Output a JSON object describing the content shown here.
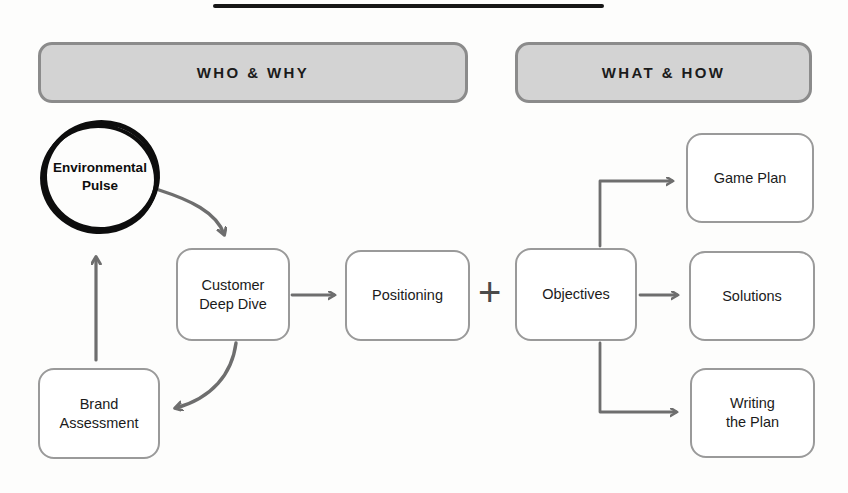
{
  "diagram": {
    "title_rule": "",
    "phases": [
      {
        "id": "who-why",
        "label": "WHO & WHY",
        "x": 38,
        "y": 42,
        "w": 430,
        "h": 61
      },
      {
        "id": "what-how",
        "label": "WHAT & HOW",
        "x": 515,
        "y": 42,
        "w": 297,
        "h": 61
      }
    ],
    "circle_node": {
      "id": "environmental-pulse",
      "label": "Environmental\nPulse",
      "line1": "Environmental",
      "line2": "Pulse",
      "cx": 100,
      "cy": 177
    },
    "nodes": [
      {
        "id": "customer-deep-dive",
        "label": "Customer\nDeep Dive",
        "line1": "Customer",
        "line2": "Deep Dive",
        "x": 176,
        "y": 248,
        "w": 114,
        "h": 93
      },
      {
        "id": "brand-assessment",
        "label": "Brand\nAssessment",
        "line1": "Brand",
        "line2": "Assessment",
        "x": 38,
        "y": 368,
        "w": 122,
        "h": 91
      },
      {
        "id": "positioning",
        "label": "Positioning",
        "line1": "Positioning",
        "line2": "",
        "x": 345,
        "y": 250,
        "w": 125,
        "h": 91
      },
      {
        "id": "objectives",
        "label": "Objectives",
        "line1": "Objectives",
        "line2": "",
        "x": 515,
        "y": 248,
        "w": 122,
        "h": 93
      },
      {
        "id": "game-plan",
        "label": "Game Plan",
        "line1": "Game Plan",
        "line2": "",
        "x": 686,
        "y": 133,
        "w": 128,
        "h": 90
      },
      {
        "id": "solutions",
        "label": "Solutions",
        "line1": "Solutions",
        "line2": "",
        "x": 689,
        "y": 251,
        "w": 126,
        "h": 90
      },
      {
        "id": "writing-the-plan",
        "label": "Writing\nthe Plan",
        "line1": "Writing",
        "line2": "the Plan",
        "x": 690,
        "y": 368,
        "w": 125,
        "h": 90
      }
    ],
    "plus_connector": {
      "id": "plus-connector",
      "label": "+",
      "x": 478,
      "y": 272
    },
    "colors": {
      "phase_bar_fill": "#d3d3d3",
      "phase_bar_stroke": "#8b8b8b",
      "node_stroke": "#9a9a9a",
      "arrow_stroke": "#6e6e6e",
      "ink_black": "#0d0d0d",
      "text": "#1b1b1b",
      "background": "#fdfdfc"
    },
    "connectors": [
      {
        "id": "pulse-to-customer",
        "from": "environmental-pulse",
        "to": "customer-deep-dive",
        "style": "curved"
      },
      {
        "id": "customer-to-brand",
        "from": "customer-deep-dive",
        "to": "brand-assessment",
        "style": "curved"
      },
      {
        "id": "brand-to-pulse",
        "from": "brand-assessment",
        "to": "environmental-pulse",
        "style": "straight-up"
      },
      {
        "id": "customer-to-positioning",
        "from": "customer-deep-dive",
        "to": "positioning",
        "style": "straight-right"
      },
      {
        "id": "objectives-to-gameplan",
        "from": "objectives",
        "to": "game-plan",
        "style": "elbow-up"
      },
      {
        "id": "objectives-to-solutions",
        "from": "objectives",
        "to": "solutions",
        "style": "straight-right"
      },
      {
        "id": "objectives-to-writing",
        "from": "objectives",
        "to": "writing-the-plan",
        "style": "elbow-down"
      }
    ]
  }
}
